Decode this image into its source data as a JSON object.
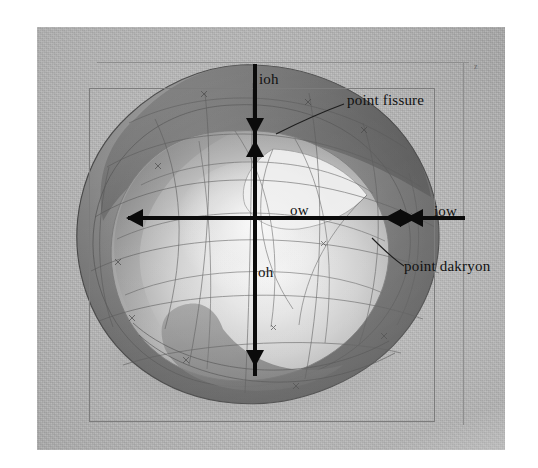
{
  "figure": {
    "kind": "3d-orbit-model-diagram",
    "background_color": "#ffffff",
    "plate_color": "#b3b3b3",
    "annotation_color": "#111111",
    "arrow_color": "#0b0b0b",
    "frame_line_color": "#7c7c7c"
  },
  "labels": {
    "ioh": "ioh",
    "iow": "iow",
    "ow": "ow",
    "oh": "oh",
    "point_fissure": "point fissure",
    "point_dakryon": "point dakryon",
    "axis_tick": "z"
  },
  "measurements": [
    {
      "id": "ioh",
      "label": "ioh",
      "kind": "vertical-interval",
      "description": "inferior-orbital height offset, double arrowhead at top of orbit"
    },
    {
      "id": "oh",
      "label": "oh",
      "kind": "vertical-span",
      "description": "orbital height, vertical axis through orbit centre"
    },
    {
      "id": "ow",
      "label": "ow",
      "kind": "horizontal-span",
      "description": "orbital width, horizontal axis through orbit centre"
    },
    {
      "id": "iow",
      "label": "iow",
      "kind": "horizontal-interval",
      "description": "inner orbital width offset at lateral margin"
    }
  ],
  "landmarks": [
    {
      "id": "point-fissure",
      "label": "point fissure",
      "description": "superior orbital fissure landmark, leader line to upper-right rim"
    },
    {
      "id": "point-dakryon",
      "label": "point dakryon",
      "description": "dakryon landmark, leader line to lateral-right rim"
    }
  ]
}
